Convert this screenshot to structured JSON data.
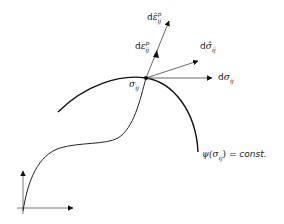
{
  "diagram": {
    "title": "",
    "colors": {
      "stroke": "#222222",
      "thin": "#555555",
      "background": "#ffffff"
    },
    "labels": {
      "stress_point": {
        "base": "σ",
        "sub": "ij"
      },
      "d_sigma": {
        "prefix": "d",
        "base": "σ",
        "sub": "ij"
      },
      "d_sigma_hat": {
        "prefix": "d",
        "base": "σ̂",
        "sub": "ij"
      },
      "d_eps_p": {
        "prefix": "d",
        "base": "ε",
        "sub": "ij",
        "sup": "p"
      },
      "d_eps_hat_p": {
        "prefix": "d",
        "base": "ε̂",
        "sub": "ij",
        "sup": "p"
      },
      "yield_surface": {
        "func": "ψ(",
        "base": "σ",
        "sub": "ij",
        "close": ")",
        "eq": " = ",
        "rhs": "const."
      }
    },
    "elements": [
      {
        "id": "axes",
        "type": "axes",
        "origin": [
          23,
          208
        ],
        "x_end": [
          74,
          208
        ],
        "y_end": [
          23,
          170
        ]
      },
      {
        "id": "stress-path",
        "type": "curve",
        "description": "loading path from origin to stress point"
      },
      {
        "id": "yield-surface",
        "type": "arc",
        "description": "yield surface ψ(σij)=const."
      },
      {
        "id": "d_sigma",
        "type": "arrow",
        "from": [
          146,
          78
        ],
        "to": [
          213,
          78
        ]
      },
      {
        "id": "d_sigma_hat",
        "type": "arrow",
        "from": [
          146,
          78
        ],
        "to": [
          199,
          61
        ]
      },
      {
        "id": "d_eps_hat_p",
        "type": "arrow",
        "from": [
          146,
          78
        ],
        "to": [
          170,
          20
        ]
      },
      {
        "id": "d_eps_p",
        "type": "arrow",
        "from": [
          146,
          78
        ],
        "to": [
          157,
          52
        ]
      }
    ]
  }
}
